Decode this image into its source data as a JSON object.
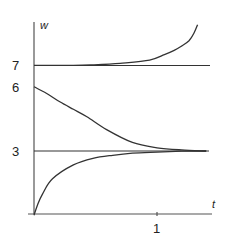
{
  "chart_data": {
    "type": "line",
    "title": "",
    "xlabel": "t",
    "ylabel": "w",
    "xlim": [
      0,
      1.44
    ],
    "ylim": [
      0,
      9.4
    ],
    "x_ticks": [
      {
        "value": 1,
        "label": "1"
      }
    ],
    "y_ticks": [
      {
        "value": 7,
        "label": "7"
      },
      {
        "value": 6,
        "label": "6"
      },
      {
        "value": 3,
        "label": "3"
      }
    ],
    "grid": false,
    "legend": null,
    "reference_lines": [
      {
        "name": "equilibrium w=7",
        "y": 7,
        "x_range": [
          0,
          1.43
        ]
      },
      {
        "name": "equilibrium w=3",
        "y": 3,
        "x_range": [
          0,
          1.42
        ]
      }
    ],
    "series": [
      {
        "name": "solution above 7 (diverging)",
        "x": [
          0,
          0.3,
          0.46,
          0.7,
          0.94,
          1.06,
          1.14,
          1.2,
          1.26,
          1.3,
          1.33
        ],
        "y": [
          7.0,
          7.0,
          7.02,
          7.1,
          7.25,
          7.5,
          7.7,
          7.9,
          8.15,
          8.5,
          8.9
        ]
      },
      {
        "name": "solution from 6 (decreasing to 3)",
        "x": [
          0,
          0.1,
          0.21,
          0.32,
          0.43,
          0.59,
          0.8,
          1.0,
          1.2,
          1.4
        ],
        "y": [
          6.0,
          5.7,
          5.3,
          4.95,
          4.6,
          4.0,
          3.4,
          3.15,
          3.05,
          3.0
        ]
      },
      {
        "name": "solution from 0 (increasing to 3)",
        "x": [
          0,
          0.03,
          0.07,
          0.15,
          0.32,
          0.48,
          0.64,
          0.8,
          1.0,
          1.2,
          1.4
        ],
        "y": [
          0,
          0.5,
          1.0,
          1.7,
          2.35,
          2.66,
          2.8,
          2.9,
          2.95,
          2.99,
          3.0
        ]
      }
    ]
  },
  "labels": {
    "y_axis": "w",
    "x_axis": "t",
    "tick_7": "7",
    "tick_6": "6",
    "tick_3": "3",
    "tick_x1": "1"
  }
}
